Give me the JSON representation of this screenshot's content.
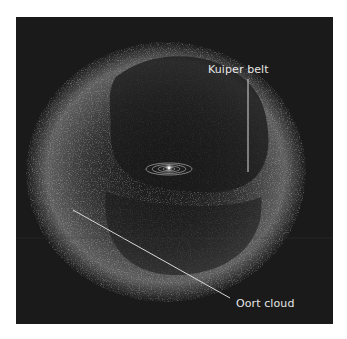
{
  "diagram": {
    "labels": {
      "kuiper_belt": "Kuiper belt",
      "oort_cloud": "Oort cloud"
    },
    "colors": {
      "background": "#1a1a1a",
      "page": "#ffffff",
      "cloud_particles": "#9a9a9a",
      "leader_lines": "#d8d8d8",
      "text": "#e6e6e6",
      "sun": "#ffffff"
    },
    "elements": [
      "Oort cloud (spherical particle shell with dark inner hollow)",
      "Kuiper belt (ring around planetary orbits)",
      "Planetary orbits (concentric ellipses)",
      "Sun (central bright point)"
    ]
  }
}
